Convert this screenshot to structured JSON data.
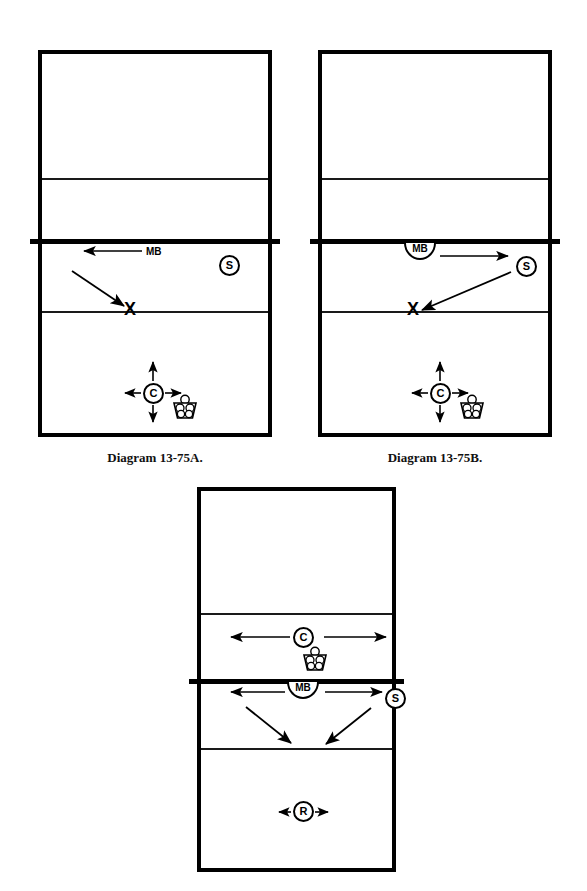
{
  "document": {
    "kind": "volleyball-drill-diagrams",
    "background_color": "#ffffff",
    "line_color": "#000000"
  },
  "diagrams": [
    {
      "id": "A",
      "caption": "Diagram 13-75A.",
      "court": {
        "x": 38,
        "y": 50,
        "width": 234,
        "height": 387
      },
      "lines": {
        "attack_line_far_y": 178,
        "net_line_y": 241,
        "attack_line_near_y": 311
      },
      "tokens": [
        {
          "name": "setter",
          "label": "S",
          "shape": "circle",
          "x": 219,
          "y": 255
        },
        {
          "name": "middle-blocker",
          "label": "MB",
          "shape": "text",
          "x": 146,
          "y": 250
        },
        {
          "name": "coach",
          "label": "C",
          "shape": "circle",
          "x": 153,
          "y": 383
        },
        {
          "name": "target-x",
          "label": "X",
          "shape": "x-mark",
          "x": 130,
          "y": 310
        },
        {
          "name": "ball-basket",
          "label": "",
          "shape": "basket",
          "x": 178,
          "y": 398
        }
      ],
      "arrows": [
        {
          "name": "mb-lateral-move",
          "from": [
            143,
            251
          ],
          "to": [
            82,
            251
          ]
        },
        {
          "name": "mb-approach-to-x",
          "from": [
            73,
            272
          ],
          "to": [
            126,
            308
          ]
        }
      ],
      "coach_movement_arrows": [
        "up",
        "down",
        "left",
        "right"
      ]
    },
    {
      "id": "B",
      "caption": "Diagram 13-75B.",
      "court": {
        "x": 318,
        "y": 50,
        "width": 234,
        "height": 387
      },
      "lines": {
        "attack_line_far_y": 178,
        "net_line_y": 241,
        "attack_line_near_y": 311
      },
      "tokens": [
        {
          "name": "setter",
          "label": "S",
          "shape": "circle",
          "x": 516,
          "y": 256
        },
        {
          "name": "middle-blocker",
          "label": "MB",
          "shape": "half-circle",
          "x": 404,
          "y": 243
        },
        {
          "name": "coach",
          "label": "C",
          "shape": "circle",
          "x": 440,
          "y": 383
        },
        {
          "name": "target-x",
          "label": "X",
          "shape": "x-mark",
          "x": 413,
          "y": 310
        },
        {
          "name": "ball-basket",
          "label": "",
          "shape": "basket",
          "x": 464,
          "y": 398
        }
      ],
      "arrows": [
        {
          "name": "mb-lateral-move",
          "from": [
            443,
            256
          ],
          "to": [
            508,
            256
          ]
        },
        {
          "name": "setter-set-to-x",
          "from": [
            505,
            272
          ],
          "to": [
            420,
            311
          ]
        }
      ],
      "coach_movement_arrows": [
        "up",
        "down",
        "left",
        "right"
      ]
    },
    {
      "id": "C",
      "caption": "",
      "court": {
        "x": 197,
        "y": 487,
        "width": 199,
        "height": 385
      },
      "lines": {
        "attack_line_far_y": 613,
        "net_line_y": 681,
        "attack_line_near_y": 748
      },
      "tokens": [
        {
          "name": "coach",
          "label": "C",
          "shape": "circle",
          "x": 303,
          "y": 631
        },
        {
          "name": "ball-basket",
          "label": "",
          "shape": "basket",
          "x": 310,
          "y": 645
        },
        {
          "name": "middle-blocker",
          "label": "MB",
          "shape": "half-circle",
          "x": 292,
          "y": 683
        },
        {
          "name": "setter",
          "label": "S",
          "shape": "circle",
          "x": 392,
          "y": 696
        },
        {
          "name": "receiver",
          "label": "R",
          "shape": "circle",
          "x": 303,
          "y": 809
        }
      ],
      "arrows": [
        {
          "name": "coach-move-left",
          "from": [
            290,
            637
          ],
          "to": [
            230,
            637
          ]
        },
        {
          "name": "coach-move-right",
          "from": [
            323,
            637
          ],
          "to": [
            387,
            637
          ]
        },
        {
          "name": "mb-move-left",
          "from": [
            290,
            692
          ],
          "to": [
            230,
            692
          ]
        },
        {
          "name": "mb-move-right",
          "from": [
            325,
            692
          ],
          "to": [
            385,
            692
          ]
        },
        {
          "name": "mb-attack-left",
          "from": [
            245,
            708
          ],
          "to": [
            290,
            745
          ]
        },
        {
          "name": "setter-set-left",
          "from": [
            370,
            710
          ],
          "to": [
            325,
            746
          ]
        },
        {
          "name": "receiver-move-left",
          "from": [
            298,
            815
          ],
          "to": [
            283,
            815
          ]
        },
        {
          "name": "receiver-move-right",
          "from": [
            323,
            815
          ],
          "to": [
            338,
            815
          ]
        }
      ]
    }
  ],
  "legend_symbols": {
    "S": "Setter",
    "MB": "Middle Blocker",
    "C": "Coach",
    "R": "Receiver",
    "X": "Target spot",
    "basket": "Ball cart"
  }
}
